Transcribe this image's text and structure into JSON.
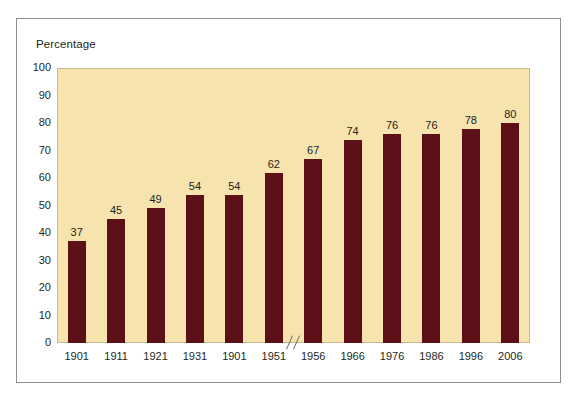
{
  "chart_data": {
    "type": "bar",
    "title": "",
    "subtitle": "",
    "xlabel": "",
    "ylabel": "Percentage",
    "ylim": [
      0,
      100
    ],
    "ytick_step": 10,
    "yticks": [
      100,
      90,
      80,
      70,
      60,
      50,
      40,
      30,
      20,
      10,
      0
    ],
    "categories": [
      "1901",
      "1911",
      "1921",
      "1931",
      "1901",
      "1951",
      "1956",
      "1966",
      "1976",
      "1986",
      "1996",
      "2006"
    ],
    "values": [
      37,
      45,
      49,
      54,
      54,
      62,
      67,
      74,
      76,
      76,
      78,
      80
    ],
    "value_labels": [
      "37",
      "45",
      "49",
      "54",
      "54",
      "62",
      "67",
      "74",
      "76",
      "76",
      "78",
      "80"
    ],
    "grid": false,
    "legend": null,
    "annotations": [
      {
        "name": "x-axis-break",
        "type": "axis-break",
        "between": [
          "1951",
          "1956"
        ],
        "glyph": "//"
      }
    ],
    "colors": {
      "bar": "#5e1018",
      "plot_background": "#f7e3ae",
      "plot_border": "#c9b98c",
      "page_background": "#ffffff",
      "frame_border": "#8d8d8d",
      "text": "#231f20"
    }
  }
}
